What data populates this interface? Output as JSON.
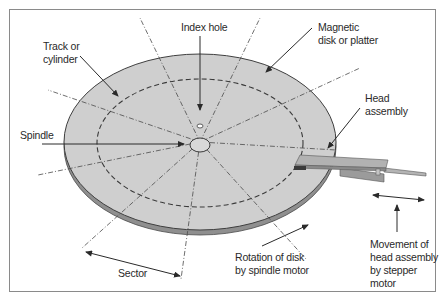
{
  "figure": {
    "colors": {
      "platter": "#cfcfcf",
      "platter_edge": "#9a9a9a",
      "outline": "#4a4a4a",
      "head": "#a9a9a9",
      "frame": "#8a8a8a"
    }
  },
  "labels": {
    "index_hole": "Index hole",
    "magnetic_disk_line1": "Magnetic",
    "magnetic_disk_line2": "disk or platter",
    "track_line1": "Track or",
    "track_line2": "cylinder",
    "head_line1": "Head",
    "head_line2": "assembly",
    "spindle": "Spindle",
    "sector": "Sector",
    "rotation_line1": "Rotation of disk",
    "rotation_line2": "by spindle motor",
    "movement_line1": "Movement of",
    "movement_line2": "head assembly",
    "movement_line3": "by stepper",
    "movement_line4": "motor"
  }
}
